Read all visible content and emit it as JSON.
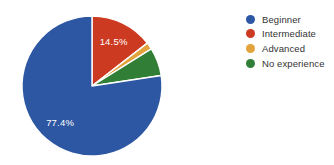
{
  "canvas": {
    "width": 334,
    "height": 165,
    "background": "#ffffff"
  },
  "chart_data": {
    "type": "pie",
    "title": "",
    "categories": [
      "Beginner",
      "Intermediate",
      "Advanced",
      "No experience"
    ],
    "values": [
      77.4,
      14.5,
      1.6,
      6.5
    ],
    "unit": "%",
    "colors": {
      "Beginner": "#2d57a3",
      "Intermediate": "#cb3a21",
      "Advanced": "#e3a33c",
      "No experience": "#317f36"
    },
    "data_labels_visible": {
      "Beginner": "77.4%",
      "Intermediate": "14.5%"
    },
    "slice_draw_order_clockwise_from_top": [
      "Intermediate",
      "Advanced",
      "No experience",
      "Beginner"
    ],
    "slice_separator_color": "#ffffff",
    "data_label_text_color": "#ffffff",
    "legend_position": "right"
  },
  "legend": {
    "items": [
      {
        "label": "Beginner",
        "color": "#2d57a3"
      },
      {
        "label": "Intermediate",
        "color": "#cb3a21"
      },
      {
        "label": "Advanced",
        "color": "#e3a33c"
      },
      {
        "label": "No experience",
        "color": "#317f36"
      }
    ],
    "text_color": "#333333"
  }
}
